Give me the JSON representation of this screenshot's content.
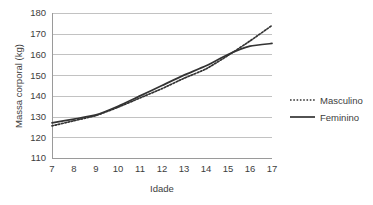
{
  "chart_data": {
    "type": "line",
    "title": "",
    "xlabel": "Idade",
    "ylabel": "Massa corporal (kg)",
    "x": [
      7,
      8,
      9,
      10,
      11,
      12,
      13,
      14,
      15,
      16,
      17
    ],
    "xtick_labels": [
      "7",
      "8",
      "9",
      "10",
      "11",
      "12",
      "13",
      "14",
      "15",
      "16",
      "17"
    ],
    "ytick_labels": [
      "110",
      "120",
      "130",
      "140",
      "150",
      "160",
      "170",
      "180"
    ],
    "yticks": [
      110,
      120,
      130,
      140,
      150,
      160,
      170,
      180
    ],
    "xlim": [
      7,
      17
    ],
    "ylim": [
      110,
      180
    ],
    "grid": "horizontal",
    "legend_position": "right",
    "series": [
      {
        "name": "Masculino",
        "style": "dotted",
        "color": "#333333",
        "values": [
          125.5,
          128.0,
          130.5,
          134.5,
          139.0,
          143.5,
          148.5,
          153.0,
          159.5,
          166.5,
          174.0
        ]
      },
      {
        "name": "Feminino",
        "style": "solid",
        "color": "#333333",
        "values": [
          127.0,
          128.8,
          130.8,
          135.0,
          140.0,
          145.0,
          150.0,
          154.5,
          160.0,
          164.0,
          165.3
        ]
      }
    ]
  },
  "legend": {
    "items": [
      {
        "label": "Masculino",
        "style": "dotted"
      },
      {
        "label": "Feminino",
        "style": "solid"
      }
    ]
  },
  "corner": {
    "mark": ""
  }
}
